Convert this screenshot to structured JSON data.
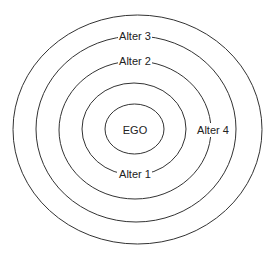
{
  "diagram": {
    "type": "concentric-circles",
    "center": {
      "x": 137,
      "y": 130
    },
    "rings": [
      {
        "name": "ego",
        "rx": 29.5,
        "ry": 25
      },
      {
        "name": "ring-1",
        "rx": 52,
        "ry": 46
      },
      {
        "name": "ring-2",
        "rx": 76,
        "ry": 69
      },
      {
        "name": "ring-3",
        "rx": 100,
        "ry": 93
      },
      {
        "name": "ring-4",
        "rx": 124.5,
        "ry": 114.5
      }
    ],
    "labels": {
      "ego": "EGO",
      "alter1": "Alter 1",
      "alter2": "Alter 2",
      "alter3": "Alter 3",
      "alter4": "Alter 4"
    },
    "stroke_color": "#333333",
    "background": "#ffffff"
  }
}
